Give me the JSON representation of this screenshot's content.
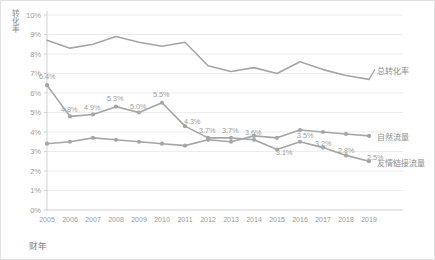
{
  "chart_data": {
    "type": "line",
    "title": "",
    "xlabel": "财年",
    "ylabel": "转化率",
    "categories": [
      "2005",
      "2006",
      "2007",
      "2008",
      "2009",
      "2010",
      "2011",
      "2012",
      "2013",
      "2014",
      "2015",
      "2016",
      "2017",
      "2018",
      "2019"
    ],
    "ylim": [
      0,
      10
    ],
    "yticks": [
      "0%",
      "1%",
      "2%",
      "3%",
      "4%",
      "5%",
      "6%",
      "7%",
      "8%",
      "9%",
      "10%"
    ],
    "grid": true,
    "legend": "inline-right-of-series",
    "series": [
      {
        "name": "总转化率",
        "values": [
          8.7,
          8.3,
          8.5,
          8.9,
          8.6,
          8.4,
          8.6,
          7.4,
          7.1,
          7.3,
          7.0,
          7.6,
          7.2,
          6.9,
          6.7
        ],
        "labels": []
      },
      {
        "name": "友情链接流量",
        "values": [
          6.4,
          4.8,
          4.9,
          5.3,
          5.0,
          5.5,
          4.3,
          3.7,
          3.7,
          3.6,
          3.1,
          3.5,
          3.2,
          2.8,
          2.5
        ],
        "labels": [
          "6.4%",
          "4.8%",
          "4.9%",
          "5.3%",
          "5.0%",
          "5.5%",
          "4.3%",
          "3.7%",
          "3.7%",
          "3.6%",
          "3.1%",
          "3.5%",
          "3.2%",
          "2.8%",
          "2.5%"
        ]
      },
      {
        "name": "自然流量",
        "values": [
          3.4,
          3.5,
          3.7,
          3.6,
          3.5,
          3.4,
          3.3,
          3.6,
          3.5,
          3.8,
          3.7,
          4.1,
          4.0,
          3.9,
          3.8
        ],
        "labels": []
      }
    ],
    "colors": {
      "line": "#a6a6a6",
      "gridline": "#ededed",
      "axis": "#d2d2d2",
      "text": "#9a9a9a",
      "background": "#ffffff"
    }
  }
}
